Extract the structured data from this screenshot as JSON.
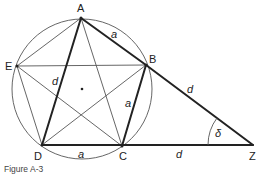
{
  "figure": {
    "caption": "Figure A-3",
    "vertices": {
      "A": {
        "label": "A",
        "x": 81,
        "y": 18
      },
      "B": {
        "label": "B",
        "x": 146,
        "y": 65
      },
      "C": {
        "label": "C",
        "x": 122,
        "y": 146
      },
      "D": {
        "label": "D",
        "x": 42,
        "y": 145
      },
      "E": {
        "label": "E",
        "x": 17,
        "y": 66
      },
      "Z": {
        "label": "Z",
        "x": 253,
        "y": 145
      }
    },
    "circle": {
      "cx": 82,
      "cy": 89,
      "r": 70
    },
    "segment_labels": {
      "AB": "a",
      "BC": "a",
      "DC": "a",
      "AD": "d",
      "BZ": "d",
      "CZ": "d"
    },
    "angle_label": "δ",
    "colors": {
      "stroke": "#222222",
      "thin": "#555555"
    }
  }
}
